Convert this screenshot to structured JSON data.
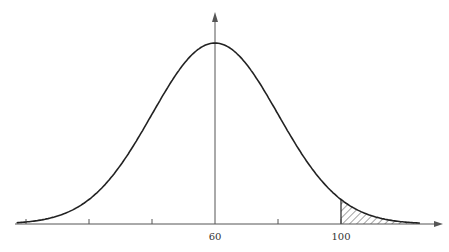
{
  "chart_data": {
    "type": "line",
    "title": "",
    "distribution": {
      "name": "normal",
      "mean": 60,
      "sd": 20
    },
    "x_axis": {
      "labels": [
        {
          "value": 60,
          "text": "60"
        },
        {
          "value": 100,
          "text": "100"
        }
      ],
      "tick_values": [
        0,
        20,
        40,
        60,
        80,
        100
      ],
      "range": [
        -3,
        125
      ],
      "arrow": true
    },
    "y_axis": {
      "at_x": 60,
      "arrow": true,
      "labels": []
    },
    "shaded_region": {
      "from": 100,
      "to": 125,
      "pattern": "diagonal-hatch",
      "side": "right-tail"
    },
    "grid": false,
    "legend": null
  },
  "colors": {
    "line": "#222222",
    "axis": "#555555",
    "hatch": "#333333",
    "background": "#ffffff"
  },
  "layout": {
    "px_per_unit": 3.15,
    "x0_px": 26,
    "baseline_px": 224,
    "peak_px": 43
  }
}
